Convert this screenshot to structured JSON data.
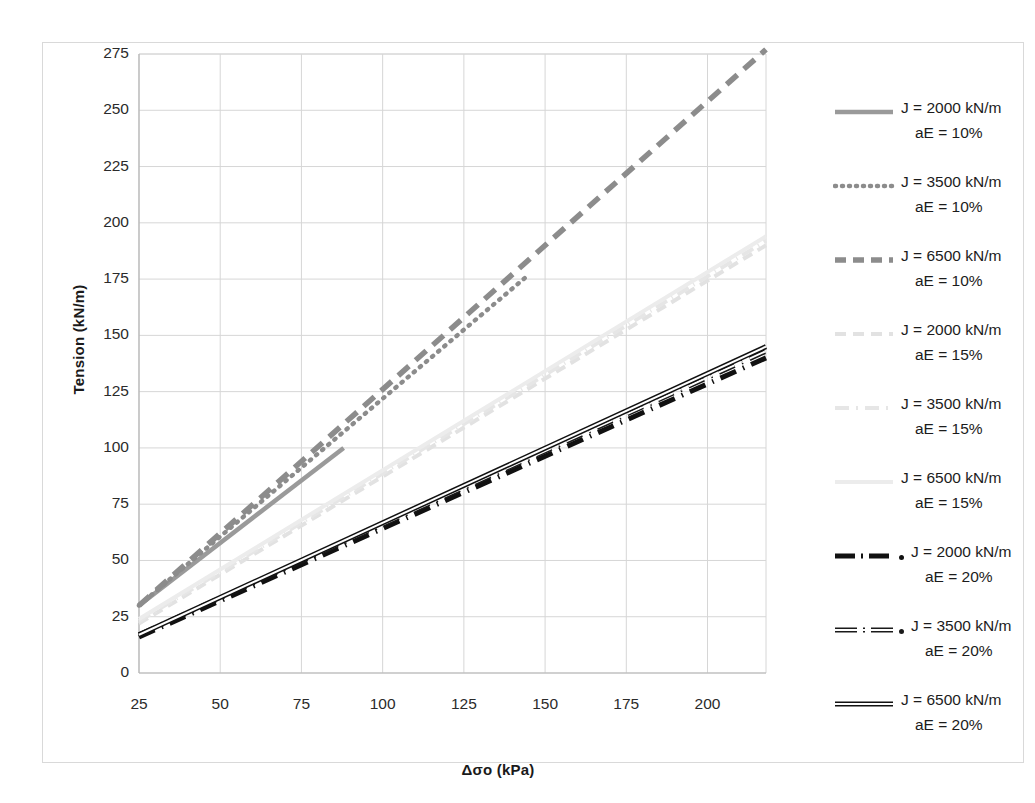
{
  "chart_data": {
    "type": "line",
    "title": "",
    "xlabel": "Δσo (kPa)",
    "ylabel": "Tension (kN/m)",
    "xlim": [
      25,
      218
    ],
    "ylim": [
      0,
      275
    ],
    "xticks": [
      25,
      50,
      75,
      100,
      125,
      150,
      175,
      200
    ],
    "yticks": [
      0,
      25,
      50,
      75,
      100,
      125,
      150,
      175,
      200,
      225,
      250,
      275
    ],
    "grid": true,
    "legend_position": "right",
    "series": [
      {
        "name": "J = 2000 kN/m aE = 10%",
        "label_line1": "J = 2000 kN/m",
        "label_line2": "aE = 10%",
        "J": 2000,
        "aE": "10%",
        "color": "#9a9a9a",
        "style": "solid",
        "width": 4.5,
        "x": [
          25,
          88
        ],
        "y": [
          30,
          100
        ]
      },
      {
        "name": "J = 3500 kN/m aE = 10%",
        "label_line1": "J = 3500 kN/m",
        "label_line2": "aE = 10%",
        "J": 3500,
        "aE": "10%",
        "color": "#8c8c8c",
        "style": "dotted",
        "width": 4.5,
        "x": [
          25,
          145
        ],
        "y": [
          30,
          177
        ]
      },
      {
        "name": "J = 6500 kN/m aE = 10%",
        "label_line1": "J = 6500 kN/m",
        "label_line2": "aE = 10%",
        "J": 6500,
        "aE": "10%",
        "color": "#8c8c8c",
        "style": "dashed",
        "width": 5.5,
        "x": [
          25,
          218
        ],
        "y": [
          30,
          277
        ]
      },
      {
        "name": "J = 2000 kN/m aE = 15%",
        "label_line1": "J = 2000 kN/m",
        "label_line2": "aE = 15%",
        "J": 2000,
        "aE": "15%",
        "color": "#e2e2e2",
        "style": "dashed",
        "width": 4,
        "x": [
          25,
          218
        ],
        "y": [
          22,
          190
        ]
      },
      {
        "name": "J = 3500 kN/m aE = 15%",
        "label_line1": "J = 3500 kN/m",
        "label_line2": "aE = 15%",
        "J": 3500,
        "aE": "15%",
        "color": "#e6e6e6",
        "style": "dashdot",
        "width": 4,
        "x": [
          25,
          218
        ],
        "y": [
          23,
          192
        ]
      },
      {
        "name": "J = 6500 kN/m aE = 15%",
        "label_line1": "J = 6500 kN/m",
        "label_line2": "aE = 15%",
        "J": 6500,
        "aE": "15%",
        "color": "#ececec",
        "style": "solid",
        "width": 4,
        "x": [
          25,
          218
        ],
        "y": [
          24,
          194
        ]
      },
      {
        "name": "J = 2000 kN/m aE = 20%",
        "label_line1": "J = 2000 kN/m",
        "label_line2": "aE = 20%",
        "J": 2000,
        "aE": "20%",
        "color": "#111111",
        "style": "dashdot-heavy",
        "width": 5,
        "x": [
          25,
          218
        ],
        "y": [
          16,
          140
        ]
      },
      {
        "name": "J = 3500 kN/m aE = 20%",
        "label_line1": "J = 3500 kN/m",
        "label_line2": "aE = 20%",
        "J": 3500,
        "aE": "20%",
        "color": "#1a1a1a",
        "style": "dashdot-double",
        "width": 5,
        "x": [
          25,
          218
        ],
        "y": [
          17,
          143
        ]
      },
      {
        "name": "J = 6500 kN/m aE = 20%",
        "label_line1": "J = 6500 kN/m",
        "label_line2": "aE = 20%",
        "J": 6500,
        "aE": "20%",
        "color": "#111111",
        "style": "double-solid",
        "width": 5,
        "x": [
          25,
          218
        ],
        "y": [
          17,
          145
        ]
      }
    ]
  },
  "axes": {
    "y_title": "Tension (kN/m)",
    "x_title": "Δσo (kPa)",
    "y_ticks": [
      "275",
      "250",
      "225",
      "200",
      "175",
      "150",
      "125",
      "100",
      "75",
      "50",
      "25",
      "0"
    ],
    "x_ticks": [
      "25",
      "50",
      "75",
      "100",
      "125",
      "150",
      "175",
      "200"
    ]
  },
  "legend": {
    "items": [
      {
        "line1": "J = 2000 kN/m",
        "line2": "aE = 10%",
        "swatch": "gray-solid"
      },
      {
        "line1": "J = 3500 kN/m",
        "line2": "aE = 10%",
        "swatch": "gray-dotted"
      },
      {
        "line1": "J = 6500 kN/m",
        "line2": "aE = 10%",
        "swatch": "gray-dashed"
      },
      {
        "line1": "J = 2000 kN/m",
        "line2": "aE = 15%",
        "swatch": "faint-dashed"
      },
      {
        "line1": "J = 3500 kN/m",
        "line2": "aE = 15%",
        "swatch": "faint-dashdot"
      },
      {
        "line1": "J = 6500 kN/m",
        "line2": "aE = 15%",
        "swatch": "faint-solid"
      },
      {
        "line1": "J = 2000 kN/m",
        "line2": "aE = 20%",
        "swatch": "black-dashdot"
      },
      {
        "line1": "J = 3500 kN/m",
        "line2": "aE = 20%",
        "swatch": "black-dashdot-double"
      },
      {
        "line1": "J = 6500 kN/m",
        "line2": "aE = 20%",
        "swatch": "black-double-solid"
      }
    ]
  },
  "colors": {
    "gray_series": "#8c8c8c",
    "faint_series": "#e6e6e6",
    "black_series": "#111111",
    "grid": "#d6d6d6",
    "frame": "#d9d9d9"
  }
}
